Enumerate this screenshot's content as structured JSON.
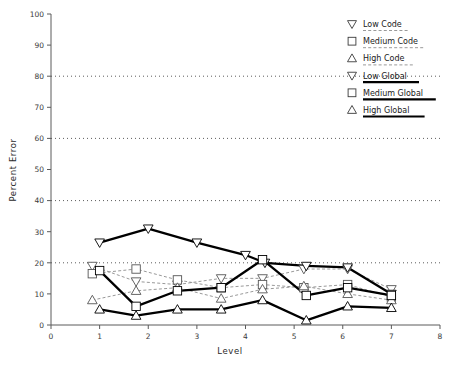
{
  "chart_data": {
    "type": "line",
    "title": "",
    "xlabel": "Level",
    "ylabel": "Percent Error",
    "xlim": [
      0,
      8
    ],
    "ylim": [
      0,
      100
    ],
    "xticks": [
      0,
      1,
      2,
      3,
      4,
      5,
      6,
      7,
      8
    ],
    "yticks": [
      0,
      10,
      20,
      30,
      40,
      50,
      60,
      70,
      80,
      90,
      100
    ],
    "xtick_labels": [
      "0",
      "1",
      "2",
      "3",
      "4",
      "5",
      "6",
      "7",
      "8"
    ],
    "ytick_labels": [
      "0",
      "10",
      "20",
      "30",
      "40",
      "50",
      "60",
      "70",
      "80",
      "90",
      "100"
    ],
    "grid": true,
    "gridlines_y": [
      20,
      40,
      60,
      80
    ],
    "legend_position": "top-right",
    "series": [
      {
        "name": "Low Code",
        "marker": "triangle-down",
        "line_style": "dashed",
        "x": [
          0.85,
          1.75,
          2.6,
          3.5,
          4.35,
          5.2,
          6.1,
          7.0
        ],
        "values": [
          19.0,
          14.0,
          13.0,
          15.0,
          15.0,
          18.0,
          18.0,
          11.5
        ]
      },
      {
        "name": "Medium Code",
        "marker": "square",
        "line_style": "dashed",
        "x": [
          0.85,
          1.75,
          2.6,
          3.5,
          4.35,
          5.2,
          6.1,
          7.0
        ],
        "values": [
          16.5,
          18.0,
          14.5,
          12.0,
          13.0,
          12.0,
          13.0,
          9.0
        ]
      },
      {
        "name": "High Code",
        "marker": "triangle-up",
        "line_style": "dashed",
        "x": [
          0.85,
          1.75,
          2.6,
          3.5,
          4.35,
          5.2,
          6.1,
          7.0
        ],
        "values": [
          8.0,
          11.0,
          12.0,
          8.5,
          11.5,
          12.5,
          10.0,
          8.0
        ]
      },
      {
        "name": "Low Global",
        "marker": "triangle-down",
        "line_style": "solid",
        "x": [
          1.0,
          2.0,
          3.0,
          4.0,
          4.4,
          5.25,
          6.1,
          7.0
        ],
        "values": [
          26.5,
          31.0,
          26.5,
          22.5,
          20.0,
          19.0,
          18.5,
          10.0
        ]
      },
      {
        "name": "Medium Global",
        "marker": "square",
        "line_style": "solid",
        "x": [
          1.0,
          1.75,
          2.6,
          3.5,
          4.35,
          5.25,
          6.1,
          7.0
        ],
        "values": [
          17.5,
          6.0,
          11.0,
          12.0,
          21.0,
          9.5,
          12.0,
          9.5
        ]
      },
      {
        "name": "High Global",
        "marker": "triangle-up",
        "line_style": "solid",
        "x": [
          1.0,
          1.75,
          2.6,
          3.5,
          4.35,
          5.25,
          6.1,
          7.0
        ],
        "values": [
          5.0,
          3.0,
          5.0,
          5.0,
          8.0,
          1.5,
          6.0,
          5.5
        ]
      }
    ]
  },
  "legend": {
    "entries": [
      {
        "label": "Low Code",
        "marker": "triangle-down-icon",
        "style": "dashed"
      },
      {
        "label": "Medium Code",
        "marker": "square-icon",
        "style": "dashed"
      },
      {
        "label": "High Code",
        "marker": "triangle-up-icon",
        "style": "dashed"
      },
      {
        "label": "Low Global",
        "marker": "triangle-down-icon",
        "style": "solid"
      },
      {
        "label": "Medium Global",
        "marker": "square-icon",
        "style": "solid"
      },
      {
        "label": "High Global",
        "marker": "triangle-up-icon",
        "style": "solid"
      }
    ]
  },
  "colors": {
    "background": "#ffffff",
    "axis": "#5a5a5a",
    "grid": "#4a4a4a",
    "dashed_series": "#8d8d8d",
    "solid_series": "#000000",
    "text": "#1a1a1a"
  }
}
